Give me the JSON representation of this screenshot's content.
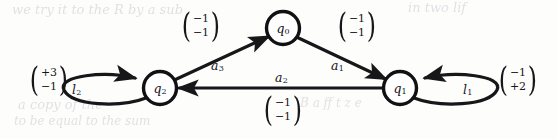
{
  "figure": {
    "type": "state-transition-diagram",
    "background_color": "#fdfdfc",
    "ink_color": "#17171a"
  },
  "nodes": [
    {
      "id": "q0",
      "label": "q",
      "subscript": "0",
      "cx": 283,
      "cy": 28,
      "r": 17
    },
    {
      "id": "q2",
      "label": "q",
      "subscript": "2",
      "cx": 160,
      "cy": 88,
      "r": 17
    },
    {
      "id": "q1",
      "label": "q",
      "subscript": "1",
      "cx": 400,
      "cy": 88,
      "r": 17
    }
  ],
  "edges": [
    {
      "id": "a3",
      "from": "q2",
      "to": "q0",
      "name": "a",
      "name_subscript": "3",
      "kind": "straight",
      "vector": {
        "top": "−1",
        "bottom": "−1"
      }
    },
    {
      "id": "a1",
      "from": "q0",
      "to": "q1",
      "name": "a",
      "name_subscript": "1",
      "kind": "straight",
      "vector": {
        "top": "−1",
        "bottom": "−1"
      }
    },
    {
      "id": "a2",
      "from": "q1",
      "to": "q2",
      "name": "a",
      "name_subscript": "2",
      "kind": "straight",
      "vector": {
        "top": "−1",
        "bottom": "−1"
      }
    },
    {
      "id": "l2",
      "from": "q2",
      "to": "q2",
      "name": "l",
      "name_subscript": "2",
      "kind": "self-loop",
      "direction": "left",
      "vector": {
        "top": "+3",
        "bottom": "−1"
      }
    },
    {
      "id": "l1",
      "from": "q1",
      "to": "q1",
      "name": "l",
      "name_subscript": "1",
      "kind": "self-loop",
      "direction": "right",
      "vector": {
        "top": "−1",
        "bottom": "+2"
      }
    }
  ],
  "ghost_text": [
    {
      "text": "we  try  it  to  the  R  by  a  sub",
      "x": 12,
      "y": 6,
      "size": 13
    },
    {
      "text": "in  two  lif",
      "x": 408,
      "y": 4,
      "size": 13
    },
    {
      "text": "a  copy  of  the",
      "x": 18,
      "y": 101,
      "size": 13
    },
    {
      "text": "to  be  equal  to  the  sum",
      "x": 14,
      "y": 118,
      "size": 12
    },
    {
      "text": "B  a  ff  t  z  e",
      "x": 300,
      "y": 100,
      "size": 12
    }
  ]
}
